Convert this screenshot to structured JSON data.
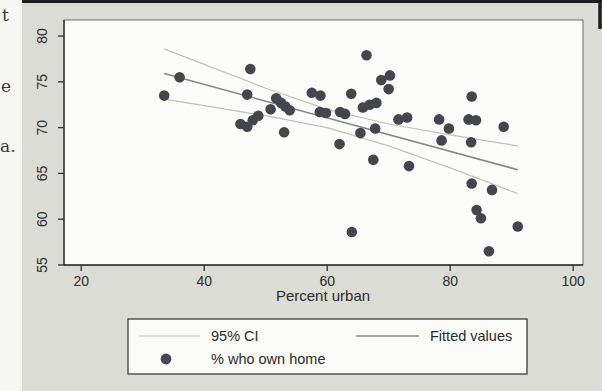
{
  "page": {
    "kind": "scanned book figure",
    "margin_glyphs": [
      "t",
      "e",
      "a."
    ]
  },
  "chart_data": {
    "type": "scatter",
    "title": "",
    "xlabel": "Percent urban",
    "ylabel": "",
    "x_ticks": [
      20,
      40,
      60,
      80,
      100
    ],
    "y_ticks": [
      55,
      60,
      65,
      70,
      75,
      80
    ],
    "xlim": [
      17.2,
      101.6
    ],
    "ylim": [
      55,
      81.75
    ],
    "grid": false,
    "legend_position": "bottom",
    "series_name": "% who own home",
    "points": [
      [
        33.5,
        73.5
      ],
      [
        36,
        75.5
      ],
      [
        47.5,
        76.4
      ],
      [
        47,
        73.6
      ],
      [
        45.9,
        70.4
      ],
      [
        47,
        70.1
      ],
      [
        47.9,
        70.8
      ],
      [
        48.8,
        71.3
      ],
      [
        50.8,
        72.0
      ],
      [
        51.7,
        73.2
      ],
      [
        52.5,
        72.7
      ],
      [
        53.2,
        72.3
      ],
      [
        53.9,
        71.9
      ],
      [
        53,
        69.5
      ],
      [
        57.5,
        73.8
      ],
      [
        58.9,
        73.5
      ],
      [
        58.8,
        71.7
      ],
      [
        59.8,
        71.6
      ],
      [
        62.1,
        71.7
      ],
      [
        62.9,
        71.5
      ],
      [
        63.9,
        73.7
      ],
      [
        62,
        68.2
      ],
      [
        64,
        58.6
      ],
      [
        65.4,
        69.4
      ],
      [
        65.8,
        72.2
      ],
      [
        66.9,
        72.5
      ],
      [
        68,
        72.7
      ],
      [
        66.4,
        77.9
      ],
      [
        67.8,
        69.9
      ],
      [
        68.8,
        75.2
      ],
      [
        70.2,
        75.7
      ],
      [
        70,
        74.2
      ],
      [
        67.5,
        66.5
      ],
      [
        71.6,
        70.9
      ],
      [
        73,
        71.1
      ],
      [
        73.3,
        65.8
      ],
      [
        78.2,
        70.9
      ],
      [
        79.8,
        69.9
      ],
      [
        78.6,
        68.6
      ],
      [
        83.4,
        68.4
      ],
      [
        83.5,
        73.4
      ],
      [
        83,
        70.9
      ],
      [
        84.2,
        70.8
      ],
      [
        83.5,
        63.9
      ],
      [
        86.8,
        63.2
      ],
      [
        84.3,
        61.0
      ],
      [
        85.0,
        60.1
      ],
      [
        86.3,
        56.5
      ],
      [
        88.7,
        70.1
      ],
      [
        91,
        59.2
      ]
    ],
    "fit_line": {
      "x": [
        33.5,
        91
      ],
      "y": [
        75.9,
        65.4
      ]
    },
    "ci_upper": [
      [
        33.5,
        78.6
      ],
      [
        40,
        76.9
      ],
      [
        50,
        74.3
      ],
      [
        60,
        72.0
      ],
      [
        70,
        70.4
      ],
      [
        80,
        69.2
      ],
      [
        91,
        68.0
      ]
    ],
    "ci_lower": [
      [
        33.5,
        73.1
      ],
      [
        40,
        72.4
      ],
      [
        50,
        71.3
      ],
      [
        60,
        70.0
      ],
      [
        70,
        68.0
      ],
      [
        80,
        65.6
      ],
      [
        91,
        62.8
      ]
    ],
    "legend": [
      {
        "label": "95% CI",
        "marker": "ci-line"
      },
      {
        "label": "Fitted values",
        "marker": "fit-line"
      },
      {
        "label": "% who own home",
        "marker": "dot"
      }
    ]
  },
  "colors": {
    "page_bg": "#dbdcd6",
    "margin_bg": "#f7f7f3",
    "plot_bg": "#fcfcfa",
    "scan_border": "#1e1e1e",
    "axis": "#2f2f2f",
    "frame": "#6f6f6c",
    "text": "#2b2b2b",
    "dot": "#45454d",
    "fit": "#84897f",
    "ci": "#bfc3ba",
    "legend_border": "#3c3c3c",
    "legend_bg": "#fbfbf9"
  }
}
